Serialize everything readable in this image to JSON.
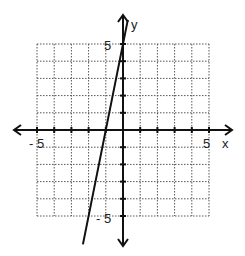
{
  "chart_data": {
    "type": "line",
    "title": "",
    "xlabel": "x",
    "ylabel": "y",
    "xlim": [
      -5,
      5
    ],
    "ylim": [
      -5,
      5
    ],
    "grid": true,
    "tick_labels": {
      "x_min": "- 5",
      "x_max": "5",
      "y_max": "5",
      "y_min": "- 5"
    },
    "series": [
      {
        "name": "line",
        "equation": "y = 5x + 5",
        "x": [
          -2,
          -1,
          0
        ],
        "y": [
          -5,
          0,
          5
        ]
      }
    ]
  },
  "labels": {
    "x_axis": "x",
    "y_axis": "y",
    "x_min": "- 5",
    "x_max": "5",
    "y_max": "5",
    "y_min": "- 5"
  }
}
